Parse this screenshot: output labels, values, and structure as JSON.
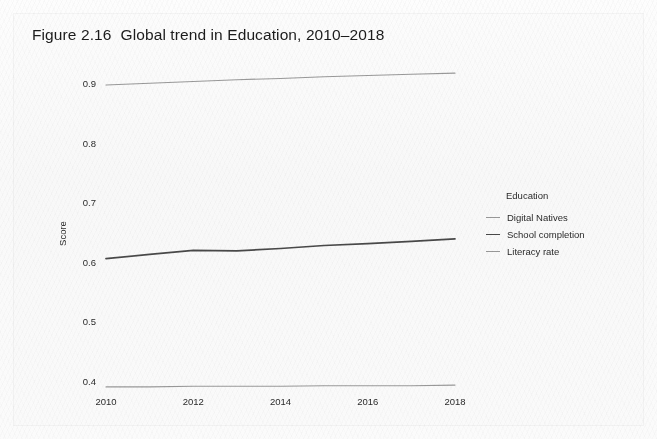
{
  "figure": {
    "number": "Figure 2.16",
    "title": "Global trend in Education, 2010–2018"
  },
  "chart_data": {
    "type": "line",
    "title": "Global trend in Education, 2010–2018",
    "xlabel": "",
    "ylabel": "Score",
    "x": [
      2010,
      2011,
      2012,
      2013,
      2014,
      2015,
      2016,
      2017,
      2018
    ],
    "xlim": [
      2010,
      2018
    ],
    "ylim": [
      0.37,
      0.94
    ],
    "xticks": [
      2010,
      2012,
      2014,
      2016,
      2018
    ],
    "xtick_labels": [
      "2010",
      "2012",
      "2014",
      "2016",
      "2018"
    ],
    "yticks": [
      0.4,
      0.5,
      0.6,
      0.7,
      0.8,
      0.9
    ],
    "ytick_labels": [
      "0.4",
      "0.5",
      "0.6",
      "0.7",
      "0.8",
      "0.9"
    ],
    "grid": false,
    "legend_title": "Education",
    "legend_position": "right",
    "series": [
      {
        "name": "Digital Natives",
        "color": "#9a9a9a",
        "width": 1.1,
        "values": [
          0.392,
          0.392,
          0.393,
          0.393,
          0.393,
          0.394,
          0.394,
          0.394,
          0.395
        ]
      },
      {
        "name": "School completion",
        "color": "#4a4a4a",
        "width": 1.7,
        "values": [
          0.607,
          0.614,
          0.621,
          0.62,
          0.624,
          0.629,
          0.632,
          0.636,
          0.64
        ]
      },
      {
        "name": "Literacy rate",
        "color": "#9a9a9a",
        "width": 1.1,
        "values": [
          0.898,
          0.901,
          0.904,
          0.907,
          0.909,
          0.912,
          0.914,
          0.916,
          0.918
        ]
      }
    ]
  }
}
